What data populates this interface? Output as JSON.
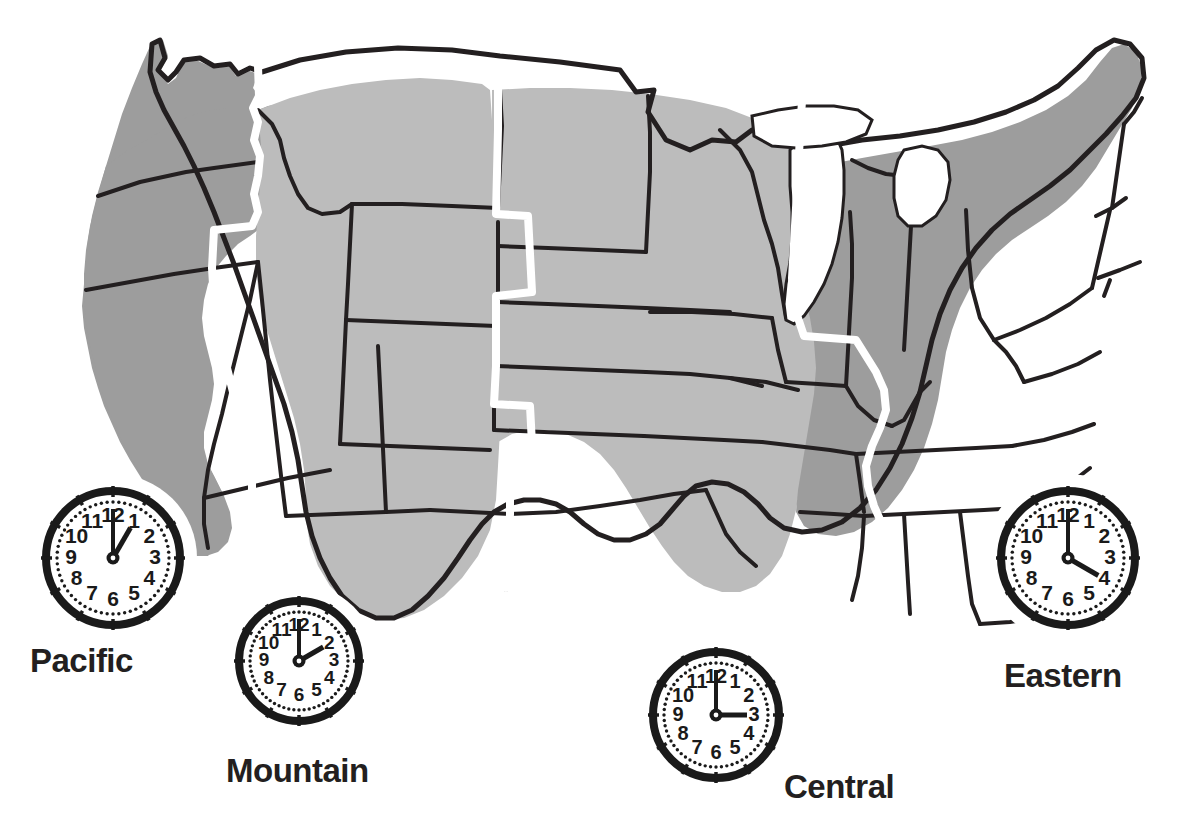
{
  "page": {
    "background_color": "#ffffff"
  },
  "map": {
    "name": "us-time-zone-map",
    "outline_color": "#231f20",
    "zone_divider_color": "#ffffff",
    "zone_divider_width_px": 7,
    "water_color": "#ffffff",
    "shades": {
      "dark_gray": "#9d9d9d",
      "light_gray": "#bcbcbc"
    }
  },
  "zones": [
    {
      "id": "pacific",
      "label": "Pacific",
      "fill": "#9d9d9d",
      "shade": "dark_gray",
      "label_x": 30,
      "label_y": 672,
      "clock": {
        "name": "pacific-clock",
        "center_x": 113,
        "center_y": 558,
        "radius": 71,
        "hour": 1,
        "minute": 0,
        "time_display": "1:00",
        "hour_hand_angle_deg": 30,
        "minute_hand_angle_deg": 0
      }
    },
    {
      "id": "mountain",
      "label": "Mountain",
      "fill": "#bcbcbc",
      "shade": "light_gray",
      "label_x": 226,
      "label_y": 782,
      "clock": {
        "name": "mountain-clock",
        "center_x": 299,
        "center_y": 661,
        "radius": 64,
        "hour": 2,
        "minute": 0,
        "time_display": "2:00",
        "hour_hand_angle_deg": 60,
        "minute_hand_angle_deg": 0
      }
    },
    {
      "id": "central",
      "label": "Central",
      "fill": "#bcbcbc",
      "shade": "light_gray",
      "label_x": 784,
      "label_y": 798,
      "clock": {
        "name": "central-clock",
        "center_x": 716,
        "center_y": 715,
        "radius": 67,
        "hour": 3,
        "minute": 0,
        "time_display": "3:00",
        "hour_hand_angle_deg": 90,
        "minute_hand_angle_deg": 0
      }
    },
    {
      "id": "eastern",
      "label": "Eastern",
      "fill": "#9d9d9d",
      "shade": "dark_gray",
      "label_x": 1004,
      "label_y": 687,
      "clock": {
        "name": "eastern-clock",
        "center_x": 1068,
        "center_y": 558,
        "radius": 71,
        "hour": 4,
        "minute": 0,
        "time_display": "4:00",
        "hour_hand_angle_deg": 120,
        "minute_hand_angle_deg": 0
      }
    }
  ],
  "clock_face": {
    "numerals": [
      "12",
      "1",
      "2",
      "3",
      "4",
      "5",
      "6",
      "7",
      "8",
      "9",
      "10",
      "11"
    ],
    "minute_dot_count": 60,
    "hour_tick_count": 12,
    "face_color": "#ffffff",
    "rim_color": "#1a1a1a",
    "hand_color": "#1a1a1a"
  }
}
